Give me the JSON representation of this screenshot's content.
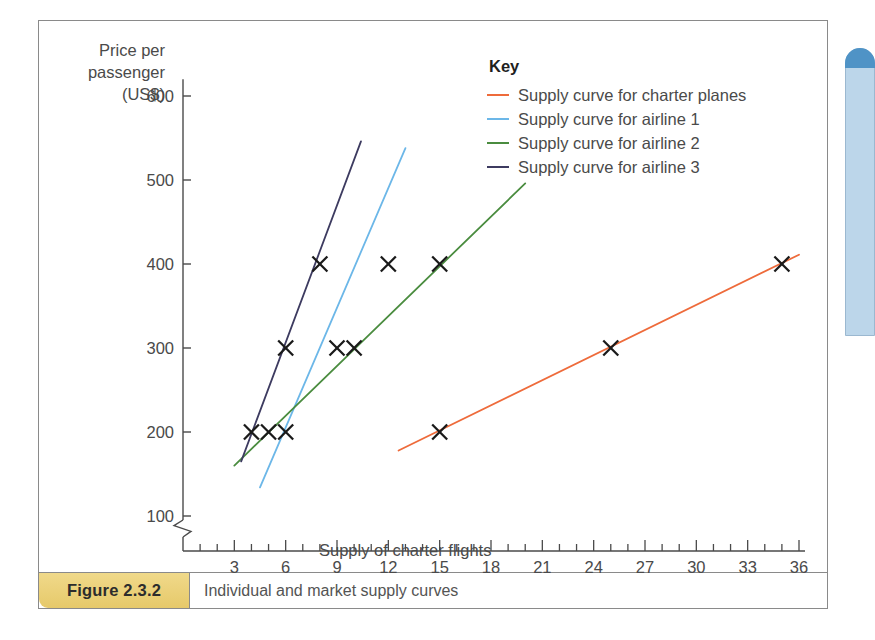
{
  "figure": {
    "number": "Figure 2.3.2",
    "caption": "Individual and market supply curves"
  },
  "legend": {
    "title": "Key",
    "entries": [
      {
        "label": "Supply curve for charter planes",
        "color": "#ee6b3b"
      },
      {
        "label": "Supply curve for airline 1",
        "color": "#6cb7e8"
      },
      {
        "label": "Supply curve for airline 2",
        "color": "#4a8c3f"
      },
      {
        "label": "Supply curve for airline 3",
        "color": "#3d3b60"
      }
    ]
  },
  "chart_data": {
    "type": "line",
    "title": "Individual and market supply curves",
    "xlabel": "Supply of charter flights",
    "ylabel": "Price per passenger (US$)",
    "ylabel_lines": [
      "Price per",
      "passenger",
      "(US$)"
    ],
    "xlim": [
      0,
      36
    ],
    "ylim": [
      50,
      620
    ],
    "y_axis_break": true,
    "y_axis_break_below": 100,
    "grid": false,
    "legend_position": "top-right",
    "xticks": [
      3,
      6,
      9,
      12,
      15,
      18,
      21,
      24,
      27,
      30,
      33,
      36
    ],
    "xticks_minor_step": 1,
    "yticks": [
      100,
      200,
      300,
      400,
      500,
      600
    ],
    "marker": "x",
    "marker_color": "#1a1a1a",
    "series": [
      {
        "name": "Supply curve for charter planes",
        "color": "#ee6b3b",
        "line_from": {
          "x": 12.6,
          "y": 178
        },
        "line_to": {
          "x": 36.0,
          "y": 411
        },
        "points": [
          {
            "x": 15,
            "y": 200
          },
          {
            "x": 25,
            "y": 300
          },
          {
            "x": 35,
            "y": 400
          }
        ]
      },
      {
        "name": "Supply curve for airline 1",
        "color": "#6cb7e8",
        "line_from": {
          "x": 4.5,
          "y": 134
        },
        "line_to": {
          "x": 13.0,
          "y": 538
        },
        "points": [
          {
            "x": 6,
            "y": 200
          },
          {
            "x": 9,
            "y": 300
          },
          {
            "x": 12,
            "y": 400
          }
        ]
      },
      {
        "name": "Supply curve for airline 2",
        "color": "#4a8c3f",
        "line_from": {
          "x": 3.0,
          "y": 160
        },
        "line_to": {
          "x": 20.0,
          "y": 496
        },
        "points": [
          {
            "x": 5,
            "y": 200
          },
          {
            "x": 10,
            "y": 300
          },
          {
            "x": 15,
            "y": 400
          }
        ]
      },
      {
        "name": "Supply curve for airline 3",
        "color": "#3d3b60",
        "line_from": {
          "x": 3.4,
          "y": 165
        },
        "line_to": {
          "x": 10.4,
          "y": 546
        },
        "points": [
          {
            "x": 4,
            "y": 200
          },
          {
            "x": 6,
            "y": 300
          },
          {
            "x": 8,
            "y": 400
          }
        ]
      }
    ]
  }
}
